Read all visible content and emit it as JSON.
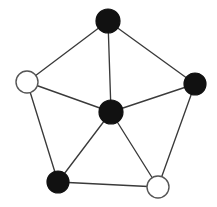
{
  "figure": {
    "name": "wheel-graph",
    "width": 217,
    "height": 207,
    "background_color": "#ffffff"
  },
  "style": {
    "edge_color": "#3a3a3a",
    "edge_width": 1.35,
    "filled_vertex_color": "#111111",
    "open_vertex_fill": "#ffffff",
    "open_vertex_stroke": "#555555",
    "vertex_stroke_width": 1.2
  },
  "graph_data": {
    "type": "node-link-diagram",
    "graph_name": "wheel-graph-W5",
    "vertex_count": 6,
    "edge_count": 10,
    "directed": false,
    "vertices": [
      {
        "id": "top",
        "label": "",
        "x": 108,
        "y": 21,
        "r": 12,
        "fill": "filled",
        "color": "#111111",
        "degree": 3
      },
      {
        "id": "right",
        "label": "",
        "x": 195,
        "y": 84,
        "r": 11,
        "fill": "filled",
        "color": "#111111",
        "degree": 3
      },
      {
        "id": "bottom-right",
        "label": "",
        "x": 158,
        "y": 187,
        "r": 11,
        "fill": "open",
        "color": "#ffffff",
        "degree": 3
      },
      {
        "id": "bottom-left",
        "label": "",
        "x": 58,
        "y": 182,
        "r": 11,
        "fill": "filled",
        "color": "#111111",
        "degree": 3
      },
      {
        "id": "left",
        "label": "",
        "x": 27,
        "y": 82,
        "r": 11,
        "fill": "open",
        "color": "#ffffff",
        "degree": 3
      },
      {
        "id": "center",
        "label": "",
        "x": 111,
        "y": 112,
        "r": 12,
        "fill": "filled",
        "color": "#111111",
        "degree": 5
      }
    ],
    "edges": [
      {
        "id": "e1",
        "source": "top",
        "target": "right",
        "group": "rim"
      },
      {
        "id": "e2",
        "source": "right",
        "target": "bottom-right",
        "group": "rim"
      },
      {
        "id": "e3",
        "source": "bottom-right",
        "target": "bottom-left",
        "group": "rim"
      },
      {
        "id": "e4",
        "source": "bottom-left",
        "target": "left",
        "group": "rim"
      },
      {
        "id": "e5",
        "source": "left",
        "target": "top",
        "group": "rim"
      },
      {
        "id": "e6",
        "source": "center",
        "target": "top",
        "group": "spoke"
      },
      {
        "id": "e7",
        "source": "center",
        "target": "right",
        "group": "spoke"
      },
      {
        "id": "e8",
        "source": "center",
        "target": "bottom-right",
        "group": "spoke"
      },
      {
        "id": "e9",
        "source": "center",
        "target": "bottom-left",
        "group": "spoke"
      },
      {
        "id": "e10",
        "source": "center",
        "target": "left",
        "group": "spoke"
      }
    ],
    "vertex_colors": {
      "filled_count": 4,
      "open_count": 2,
      "filled_ids": [
        "top",
        "right",
        "bottom-left",
        "center"
      ],
      "open_ids": [
        "left",
        "bottom-right"
      ]
    }
  }
}
